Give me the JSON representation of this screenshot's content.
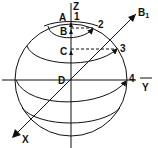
{
  "diagram": {
    "axes": {
      "z_label": "Z",
      "y_label": "Y",
      "x_label": "X",
      "b1_label": "B",
      "b1_subscript": "1"
    },
    "points": {
      "a": "A",
      "b": "B",
      "c": "C",
      "d": "D"
    },
    "markers": {
      "m1": "1",
      "m2": "2",
      "m3": "3",
      "m4": "4"
    },
    "colors": {
      "stroke": "#111111",
      "background": "#ffffff"
    }
  }
}
